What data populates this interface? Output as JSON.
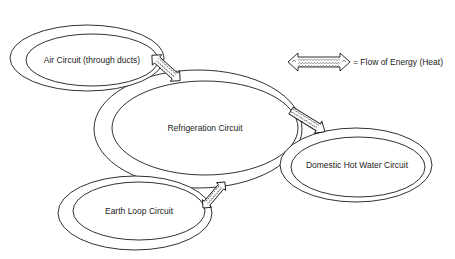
{
  "diagram": {
    "type": "energy-flow-diagram",
    "circuits": [
      {
        "id": "air",
        "label": "Air Circuit (through ducts)"
      },
      {
        "id": "refrigeration",
        "label": "Refrigeration Circuit"
      },
      {
        "id": "domestic-hot-water",
        "label": "Domestic Hot Water Circuit"
      },
      {
        "id": "earth-loop",
        "label": "Earth Loop Circuit"
      }
    ],
    "flows": [
      {
        "from": "air",
        "to": "refrigeration",
        "direction": "bidirectional"
      },
      {
        "from": "refrigeration",
        "to": "domestic-hot-water",
        "direction": "one-way"
      },
      {
        "from": "earth-loop",
        "to": "refrigeration",
        "direction": "bidirectional"
      }
    ],
    "legend": {
      "symbol": "double-headed wavy arrow",
      "label": "= Flow of Energy (Heat)"
    }
  }
}
